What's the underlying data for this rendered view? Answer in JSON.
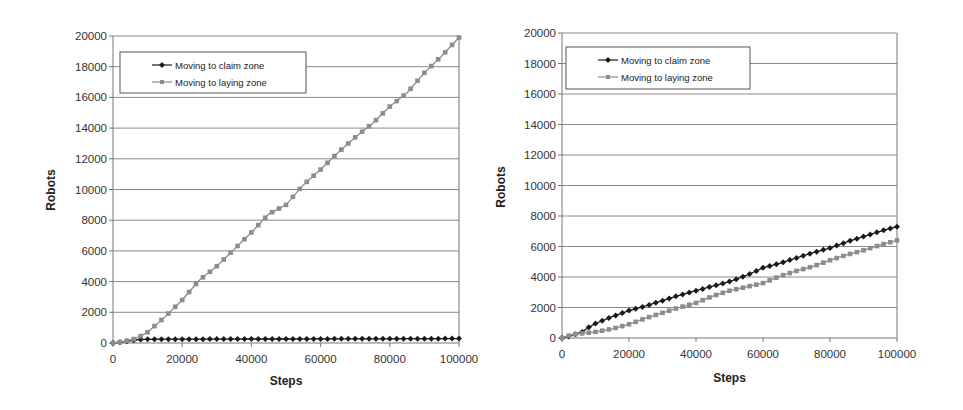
{
  "chart_data": [
    {
      "type": "line",
      "title": "",
      "xlabel": "Steps",
      "ylabel": "Robots",
      "xlim": [
        0,
        100000
      ],
      "ylim": [
        0,
        20000
      ],
      "x_ticks": [
        "0",
        "20000",
        "40000",
        "60000",
        "80000",
        "100000"
      ],
      "y_ticks": [
        "0",
        "2000",
        "4000",
        "6000",
        "8000",
        "10000",
        "12000",
        "14000",
        "16000",
        "18000",
        "20000"
      ],
      "grid": true,
      "legend_position": "upper-left",
      "x": [
        0,
        2000,
        4000,
        6000,
        8000,
        10000,
        15000,
        20000,
        25000,
        30000,
        35000,
        40000,
        45000,
        50000,
        55000,
        60000,
        65000,
        70000,
        75000,
        80000,
        85000,
        90000,
        95000,
        100000
      ],
      "series": [
        {
          "name": "Moving to claim zone",
          "color": "#1a1a1a",
          "marker": "diamond",
          "values": [
            0,
            50,
            120,
            180,
            230,
            240,
            250,
            250,
            250,
            255,
            255,
            260,
            260,
            260,
            265,
            265,
            270,
            270,
            275,
            275,
            280,
            280,
            285,
            290
          ]
        },
        {
          "name": "Moving to laying zone",
          "color": "#8c8c8c",
          "marker": "square",
          "values": [
            0,
            60,
            150,
            250,
            450,
            700,
            1700,
            2800,
            4100,
            5000,
            6100,
            7200,
            8400,
            9000,
            10300,
            11300,
            12400,
            13400,
            14300,
            15400,
            16300,
            17600,
            18700,
            19900
          ]
        }
      ]
    },
    {
      "type": "line",
      "title": "",
      "xlabel": "Steps",
      "ylabel": "Robots",
      "xlim": [
        0,
        100000
      ],
      "ylim": [
        0,
        20000
      ],
      "x_ticks": [
        "0",
        "20000",
        "40000",
        "60000",
        "80000",
        "100000"
      ],
      "y_ticks": [
        "0",
        "2000",
        "4000",
        "6000",
        "8000",
        "10000",
        "12000",
        "14000",
        "16000",
        "18000",
        "20000"
      ],
      "grid": true,
      "legend_position": "upper-left",
      "x": [
        0,
        2000,
        4000,
        6000,
        8000,
        10000,
        15000,
        20000,
        25000,
        30000,
        35000,
        40000,
        45000,
        50000,
        55000,
        60000,
        65000,
        70000,
        75000,
        80000,
        85000,
        90000,
        95000,
        100000
      ],
      "series": [
        {
          "name": "Moving to claim zone",
          "color": "#1a1a1a",
          "marker": "diamond",
          "values": [
            0,
            100,
            250,
            400,
            700,
            950,
            1400,
            1800,
            2100,
            2450,
            2800,
            3100,
            3400,
            3700,
            4100,
            4600,
            4900,
            5250,
            5600,
            5900,
            6300,
            6650,
            7000,
            7300
          ]
        },
        {
          "name": "Moving to laying zone",
          "color": "#8c8c8c",
          "marker": "square",
          "values": [
            0,
            150,
            250,
            300,
            350,
            400,
            600,
            900,
            1300,
            1650,
            2000,
            2300,
            2750,
            3100,
            3350,
            3600,
            4050,
            4400,
            4700,
            5100,
            5450,
            5750,
            6100,
            6400
          ]
        }
      ]
    }
  ]
}
